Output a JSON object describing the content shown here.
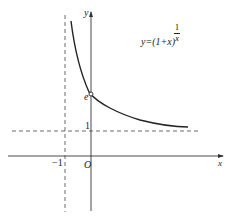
{
  "diagram": {
    "type": "function-graph",
    "function_label": {
      "lhs": "y=(1+x)",
      "exponent_numerator": "1",
      "exponent_denominator": "x"
    },
    "axes": {
      "x_label": "x",
      "y_label": "y",
      "origin_label": "O"
    },
    "asymptotes": {
      "vertical_label": "−1",
      "horizontal_label": "1"
    },
    "point_label": "e",
    "colors": {
      "stroke": "#222222",
      "dashed": "#444444",
      "background": "#ffffff"
    }
  }
}
